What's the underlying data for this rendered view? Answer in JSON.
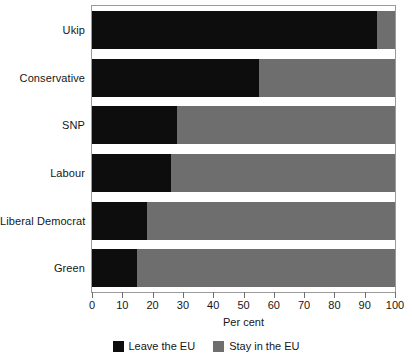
{
  "chart_data": {
    "type": "bar",
    "orientation": "horizontal",
    "stacked": true,
    "title": "",
    "xlabel": "Per cent",
    "ylabel": "",
    "xlim": [
      0,
      100
    ],
    "xticks": [
      0,
      10,
      20,
      30,
      40,
      50,
      60,
      70,
      80,
      90,
      100
    ],
    "grid": false,
    "legend_position": "bottom",
    "categories": [
      "Ukip",
      "Conservative",
      "SNP",
      "Labour",
      "Liberal Democrat",
      "Green"
    ],
    "series": [
      {
        "name": "Leave the EU",
        "color": "#0d0d0d",
        "values": [
          94,
          55,
          28,
          26,
          18,
          15
        ]
      },
      {
        "name": "Stay in the EU",
        "color": "#6e6e6e",
        "values": [
          6,
          45,
          72,
          74,
          82,
          85
        ]
      }
    ]
  },
  "axis": {
    "x_title": "Per cent",
    "tick_labels": [
      "0",
      "10",
      "20",
      "30",
      "40",
      "50",
      "60",
      "70",
      "80",
      "90",
      "100"
    ]
  },
  "categories": [
    {
      "label": "Ukip"
    },
    {
      "label": "Conservative"
    },
    {
      "label": "SNP"
    },
    {
      "label": "Labour"
    },
    {
      "label": "Liberal Democrat"
    },
    {
      "label": "Green"
    }
  ],
  "legend": {
    "items": [
      {
        "label": "Leave the EU",
        "color": "#0d0d0d"
      },
      {
        "label": "Stay in the EU",
        "color": "#6e6e6e"
      }
    ]
  }
}
